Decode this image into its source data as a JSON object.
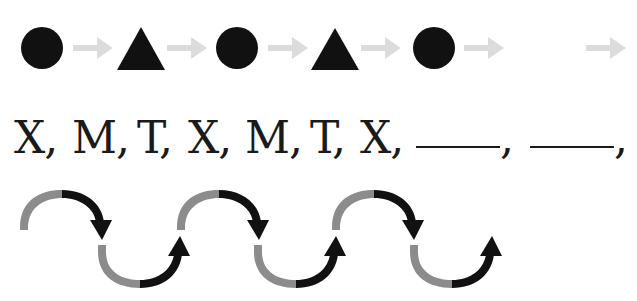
{
  "pattern_shapes": {
    "sequence": [
      "circle",
      "triangle",
      "circle",
      "triangle",
      "circle",
      "blank"
    ],
    "arrow_color": "#dcdcdc",
    "shape_color": "#111111"
  },
  "letter_sequence": {
    "items": [
      "X,",
      "M,",
      "T,",
      "X,",
      "M,",
      "T,",
      "X,"
    ],
    "blanks": [
      "",
      ""
    ],
    "blank_suffix": ","
  },
  "arrow_waves": {
    "light_color": "#8c8c8c",
    "dark_color": "#111111",
    "top_arcs": 3,
    "bottom_arcs": 3
  }
}
